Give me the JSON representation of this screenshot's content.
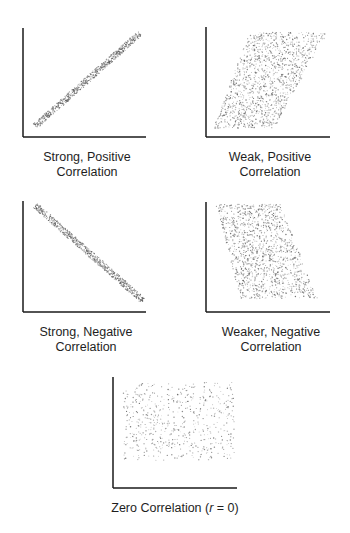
{
  "chart_data": [
    {
      "type": "scatter",
      "title": "Strong, Positive Correlation",
      "caption_lines": [
        "Strong, Positive",
        "Correlation"
      ],
      "trend": "positive",
      "strength": "strong",
      "xlabel": "",
      "ylabel": "",
      "grid": false,
      "band": {
        "x0": 0.1,
        "y0": 0.1,
        "x1": 0.95,
        "y1": 0.95,
        "width": 0.05
      },
      "axes": {
        "origin": [
          23,
          137
        ],
        "top": 28,
        "right": 146
      }
    },
    {
      "type": "scatter",
      "title": "Weak, Positive Correlation",
      "caption_lines": [
        "Weak, Positive",
        "Correlation"
      ],
      "trend": "positive",
      "strength": "weak",
      "xlabel": "",
      "ylabel": "",
      "grid": false,
      "cloud": {
        "corners": [
          [
            0.06,
            0.08
          ],
          [
            0.55,
            0.08
          ],
          [
            0.98,
            0.95
          ],
          [
            0.35,
            0.95
          ]
        ]
      },
      "axes": {
        "origin": [
          206,
          137
        ],
        "top": 27,
        "right": 330
      }
    },
    {
      "type": "scatter",
      "title": "Strong, Negative Correlation",
      "caption_lines": [
        "Strong, Negative",
        "Correlation"
      ],
      "trend": "negative",
      "strength": "strong",
      "xlabel": "",
      "ylabel": "",
      "grid": false,
      "band": {
        "x0": 0.1,
        "y0": 0.96,
        "x1": 0.98,
        "y1": 0.1,
        "width": 0.05
      },
      "axes": {
        "origin": [
          23,
          312
        ],
        "top": 201,
        "right": 146
      }
    },
    {
      "type": "scatter",
      "title": "Weaker, Negative Correlation",
      "caption_lines": [
        "Weaker, Negative",
        "Correlation"
      ],
      "trend": "negative",
      "strength": "weaker",
      "xlabel": "",
      "ylabel": "",
      "grid": false,
      "cloud": {
        "corners": [
          [
            0.08,
            0.98
          ],
          [
            0.6,
            0.98
          ],
          [
            0.9,
            0.12
          ],
          [
            0.28,
            0.12
          ]
        ]
      },
      "axes": {
        "origin": [
          206,
          312
        ],
        "top": 202,
        "right": 330
      }
    },
    {
      "type": "scatter",
      "title": "Zero Correlation (r = 0)",
      "caption_parts": [
        "Zero Correlation (",
        "r",
        " = 0)"
      ],
      "trend": "none",
      "strength": "zero",
      "r": 0,
      "xlabel": "",
      "ylabel": "",
      "grid": false,
      "cloud": {
        "corners": [
          [
            0.08,
            0.25
          ],
          [
            0.98,
            0.25
          ],
          [
            0.98,
            0.95
          ],
          [
            0.08,
            0.95
          ]
        ]
      },
      "axes": {
        "origin": [
          113,
          488
        ],
        "top": 377,
        "right": 237
      }
    }
  ],
  "colors": {
    "axis": "#1a1a1a",
    "dots": "#555555",
    "text": "#1e1e1e",
    "background": "#ffffff"
  }
}
